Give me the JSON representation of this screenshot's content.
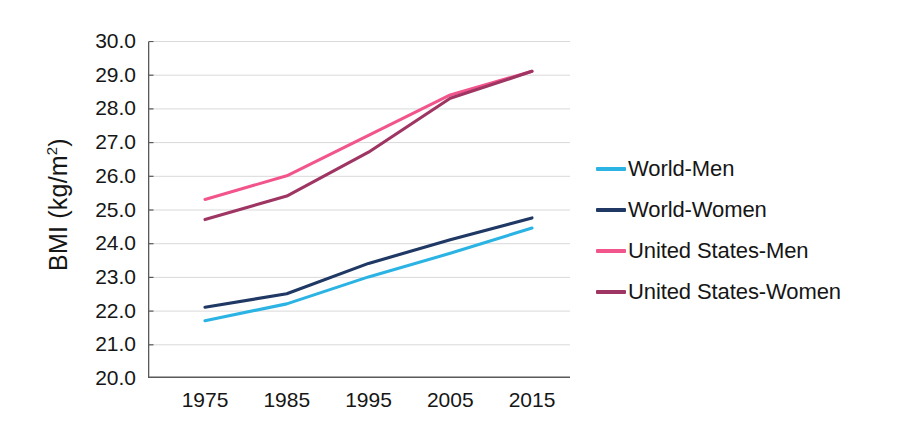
{
  "chart_data": {
    "type": "line",
    "title": "",
    "xlabel": "",
    "ylabel": "BMI (kg/m2)",
    "ylabel_base": "BMI (kg/m",
    "ylabel_sup": "2",
    "ylabel_tail": ")",
    "x": [
      1975,
      1985,
      1995,
      2005,
      2015
    ],
    "categories": [
      "1975",
      "1985",
      "1995",
      "2005",
      "2015"
    ],
    "xlim": [
      1975,
      2015
    ],
    "ylim": [
      20.0,
      30.0
    ],
    "ytick_labels": [
      "30.0",
      "29.0",
      "28.0",
      "27.0",
      "26.0",
      "25.0",
      "24.0",
      "23.0",
      "22.0",
      "21.0",
      "20.0"
    ],
    "ytick_values": [
      30.0,
      29.0,
      28.0,
      27.0,
      26.0,
      25.0,
      24.0,
      23.0,
      22.0,
      21.0,
      20.0
    ],
    "grid": true,
    "grid_color": "#D9D9D9",
    "axis_color": "#595959",
    "legend_position": "right",
    "series": [
      {
        "name": "World-Men",
        "color": "#2BB3E3",
        "values": [
          21.7,
          22.2,
          23.0,
          23.7,
          24.45
        ]
      },
      {
        "name": "World-Women",
        "color": "#1F3864",
        "values": [
          22.1,
          22.5,
          23.4,
          24.1,
          24.75
        ]
      },
      {
        "name": "United States-Men",
        "color": "#F2558C",
        "values": [
          25.3,
          26.0,
          27.2,
          28.4,
          29.1
        ]
      },
      {
        "name": "United States-Women",
        "color": "#9E3562",
        "values": [
          24.7,
          25.4,
          26.7,
          28.3,
          29.1
        ]
      }
    ]
  },
  "legend": {
    "items": [
      {
        "label": "World-Men",
        "color": "#2BB3E3"
      },
      {
        "label": "World-Women",
        "color": "#1F3864"
      },
      {
        "label": "United States-Men",
        "color": "#F2558C"
      },
      {
        "label": "United States-Women",
        "color": "#9E3562"
      }
    ]
  }
}
